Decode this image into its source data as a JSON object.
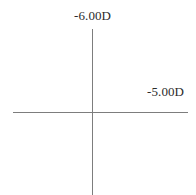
{
  "diagram": {
    "background_color": "#ffffff",
    "line_color": "#7d7d7d",
    "text_color": "#2b2b2b",
    "axes": {
      "vertical": {
        "name": "vertical-meridian-axis",
        "power_label": "-6.00D"
      },
      "horizontal": {
        "name": "horizontal-meridian-axis",
        "power_label": "-5.00D"
      }
    }
  },
  "chart_data": {
    "type": "diagram",
    "subtype": "power-cross",
    "title": "",
    "annotations": [
      {
        "text": "-6.00D",
        "axis": "vertical",
        "position": "top",
        "value": -6.0,
        "unit": "D"
      },
      {
        "text": "-5.00D",
        "axis": "horizontal",
        "position": "right",
        "value": -5.0,
        "unit": "D"
      }
    ],
    "series": [
      {
        "name": "vertical-meridian",
        "value": -6.0
      },
      {
        "name": "horizontal-meridian",
        "value": -5.0
      }
    ],
    "grid": false,
    "legend": false
  }
}
